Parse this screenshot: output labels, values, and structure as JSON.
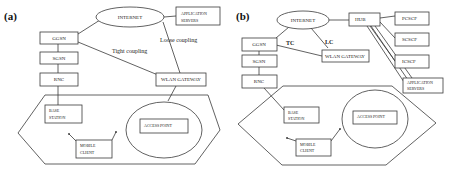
{
  "panels": [
    {
      "id": "a",
      "tag": "(a)",
      "nodes": {
        "internet": "INTERNET",
        "app_servers_line1": "APPLICATION",
        "app_servers_line2": "SERVERS",
        "ggsn": "GGSN",
        "sgsn": "SGSN",
        "rnc": "RNC",
        "wlan_gateway": "WLAN GATEWAY",
        "base_station_line1": "BASE",
        "base_station_line2": "STATION",
        "mobile_client_line1": "MOBILE",
        "mobile_client_line2": "CLIENT",
        "access_point": "ACCESS POINT"
      },
      "edge_labels": {
        "tight": "Tight coupling",
        "loose": "Loose coupling"
      }
    },
    {
      "id": "b",
      "tag": "(b)",
      "nodes": {
        "internet": "INTERNET",
        "hub": "HUB",
        "pcscf": "PCSCF",
        "scscf": "SCSCF",
        "icscf": "ICSCF",
        "app_servers_line1": "APPLICATION",
        "app_servers_line2": "SERVERS",
        "ggsn": "GGSN",
        "sgsn": "SGSN",
        "rnc": "RNC",
        "wlan_gateway": "WLAN GATEWAY",
        "base_station_line1": "BASE",
        "base_station_line2": "STATION",
        "mobile_client_line1": "MOBILE",
        "mobile_client_line2": "CLIENT",
        "access_point": "ACCESS POINT"
      },
      "edge_labels": {
        "tc": "TC",
        "lc": "LC"
      }
    }
  ]
}
